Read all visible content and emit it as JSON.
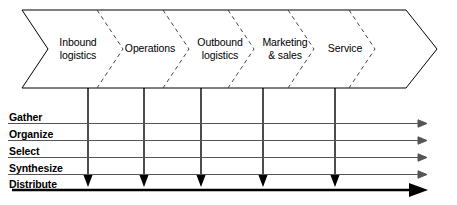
{
  "diagram": {
    "type": "process-chevron-diagram",
    "colors": {
      "stroke": "#000000",
      "band_fill": "#ffffff",
      "dashed_divider": "#444444",
      "row_line": "#555555",
      "background": "#ffffff"
    },
    "value_chain": {
      "name": "value-chain-band",
      "stages": [
        {
          "id": "inbound-logistics",
          "label": "Inbound\nlogistics",
          "center_x": 78,
          "connector_x": 88
        },
        {
          "id": "operations",
          "label": "Operations",
          "center_x": 150,
          "connector_x": 144
        },
        {
          "id": "outbound-logistics",
          "label": "Outbound\nlogistics",
          "center_x": 220,
          "connector_x": 201
        },
        {
          "id": "marketing-sales",
          "label": "Marketing\n& sales",
          "center_x": 285,
          "connector_x": 263
        },
        {
          "id": "service",
          "label": "Service",
          "center_x": 345,
          "connector_x": 335
        }
      ]
    },
    "process_rows": [
      {
        "id": "gather",
        "label": "Gather"
      },
      {
        "id": "organize",
        "label": "Organize"
      },
      {
        "id": "select",
        "label": "Select"
      },
      {
        "id": "synthesize",
        "label": "Synthesize"
      },
      {
        "id": "distribute",
        "label": "Distribute"
      }
    ]
  }
}
